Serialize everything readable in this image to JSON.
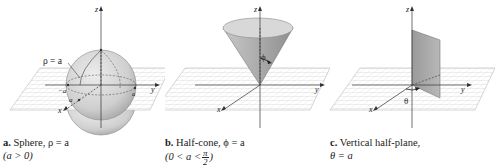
{
  "figure": {
    "panels": [
      {
        "id": "a",
        "letter": "a.",
        "title": "Sphere, ρ = a",
        "condition": "(a > 0)",
        "surface_label": "ρ = a",
        "axis_labels": {
          "x": "x",
          "y": "y",
          "z": "z"
        },
        "tick_labels": {
          "neg_a": "−a",
          "x_a": "a",
          "y_a": "a",
          "z_a": "a"
        }
      },
      {
        "id": "b",
        "letter": "b.",
        "title": "Half-cone, ϕ = a",
        "condition_prefix": "(0 < a <",
        "condition_frac_num": "π",
        "condition_frac_den": "2",
        "condition_suffix": ")",
        "angle_label": "ϕ",
        "axis_labels": {
          "x": "x",
          "y": "y",
          "z": "z"
        }
      },
      {
        "id": "c",
        "letter": "c.",
        "title": "Vertical half-plane,",
        "condition": "θ = a",
        "angle_label": "θ",
        "axis_labels": {
          "x": "x",
          "y": "y",
          "z": "z"
        }
      }
    ],
    "colors": {
      "grid": "#bdbdbd",
      "surface_light": "#e2e2e2",
      "surface_mid": "#c4c4c4",
      "surface_dark": "#9a9a9a",
      "axis": "#333333"
    }
  }
}
